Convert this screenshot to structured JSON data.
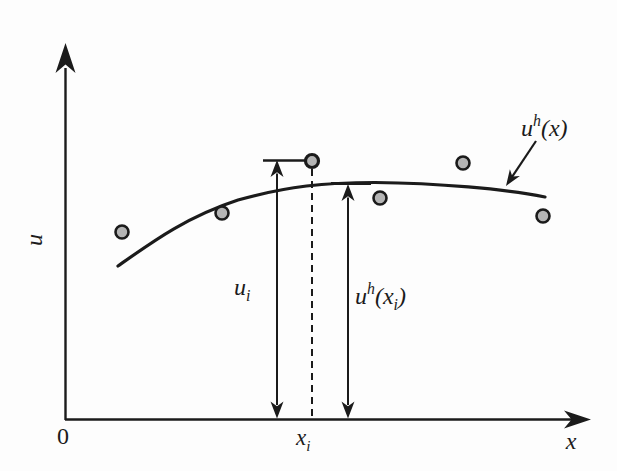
{
  "figure": {
    "background": "#fdfdfd",
    "ink": "#1b1b1b",
    "point_fill": "#b5b5b5",
    "axes": {
      "origin": [
        65,
        420
      ],
      "y_line_end": [
        65.5,
        68
      ],
      "y_tip": [
        65.5,
        43
      ],
      "y_head": {
        "len": 30,
        "halfw": 10
      },
      "x_line_end": [
        576,
        419.5
      ],
      "x_tip": [
        591,
        419.5
      ],
      "x_head": {
        "len": 27,
        "halfw": 9
      },
      "line_width": 2.4
    },
    "curve": {
      "path": "M 118 266 C 152 242 186 217 238 200 C 288 186 325 182.5 375 182.5 C 437 183 505 189 545 197",
      "width": 3.2
    },
    "points": [
      [
        122,
        232
      ],
      [
        222,
        213
      ],
      [
        380,
        198
      ],
      [
        463,
        163
      ],
      [
        543,
        216
      ]
    ],
    "special_point": [
      312,
      161
    ],
    "point_radius": 6.5,
    "ring_width": 2.6,
    "dashed_line": {
      "x": 312,
      "y1": 169,
      "y2": 419,
      "dash": "7 5",
      "width": 2
    },
    "measure_arrows": [
      {
        "name": "ui-measure-arrow",
        "x": 277,
        "top": 160,
        "bottom": 418.5,
        "cap": {
          "x1": 263,
          "x2": 305,
          "y": 160.5,
          "width": 2.5
        }
      },
      {
        "name": "uh-xi-measure-arrow",
        "x": 348,
        "top": 184,
        "bottom": 418.5,
        "cap": {
          "x1": 331,
          "x2": 371,
          "y": 183.5,
          "width": 3
        }
      }
    ],
    "measure_head": {
      "len": 17,
      "halfw": 6.5,
      "line_width": 2
    },
    "pointer_arrow": {
      "from": [
        536,
        141
      ],
      "tip": [
        506,
        186
      ],
      "len": 16,
      "halfw": 6,
      "width": 2.2
    },
    "labels": [
      {
        "name": "origin-label",
        "x": 63,
        "y": 444,
        "size": 24,
        "italic": false,
        "anchor": "middle",
        "parts": [
          {
            "t": "0"
          }
        ]
      },
      {
        "name": "y-axis-label",
        "x": 42,
        "y": 240,
        "size": 24,
        "italic": true,
        "anchor": "middle",
        "rotate": -90,
        "parts": [
          {
            "t": "u"
          }
        ]
      },
      {
        "name": "x-axis-label",
        "x": 571,
        "y": 449,
        "size": 24,
        "italic": true,
        "anchor": "middle",
        "parts": [
          {
            "t": "x"
          }
        ]
      },
      {
        "name": "xi-tick-label",
        "x": 296,
        "y": 445,
        "size": 23,
        "italic": true,
        "anchor": "start",
        "parts": [
          {
            "t": "x"
          },
          {
            "t": "i",
            "shift": "sub"
          }
        ]
      },
      {
        "name": "ui-label",
        "x": 234,
        "y": 295,
        "size": 24,
        "italic": true,
        "anchor": "start",
        "parts": [
          {
            "t": "u"
          },
          {
            "t": "i",
            "shift": "sub"
          }
        ]
      },
      {
        "name": "uh-xi-label",
        "x": 355,
        "y": 304,
        "size": 24,
        "italic": true,
        "anchor": "start",
        "parts": [
          {
            "t": "u"
          },
          {
            "t": "h",
            "shift": "sup"
          },
          {
            "t": "(x"
          },
          {
            "t": "i",
            "shift": "sub"
          },
          {
            "t": ")"
          }
        ]
      },
      {
        "name": "uh-x-label",
        "x": 521,
        "y": 136,
        "size": 24,
        "italic": true,
        "anchor": "start",
        "parts": [
          {
            "t": "u"
          },
          {
            "t": "h",
            "shift": "sup"
          },
          {
            "t": "(x)"
          }
        ]
      }
    ]
  },
  "chart_data": {
    "type": "scatter",
    "title": "",
    "xlabel": "x",
    "ylabel": "u",
    "axis_numeric_labels": false,
    "origin_label": "0",
    "x_ticks": [
      {
        "label": "x_i",
        "x_rel": 0.47
      }
    ],
    "series": [
      {
        "name": "data points",
        "type": "scatter",
        "points_rel": [
          [
            0.11,
            0.5
          ],
          [
            0.3,
            0.55
          ],
          [
            0.47,
            0.69
          ],
          [
            0.6,
            0.59
          ],
          [
            0.76,
            0.68
          ],
          [
            0.91,
            0.54
          ]
        ]
      },
      {
        "name": "u^h(x)",
        "type": "line",
        "points_rel": [
          [
            0.1,
            0.41
          ],
          [
            0.3,
            0.57
          ],
          [
            0.47,
            0.63
          ],
          [
            0.56,
            0.63
          ],
          [
            0.76,
            0.62
          ],
          [
            0.91,
            0.59
          ]
        ]
      }
    ],
    "highlighted_point": {
      "label_x": "x_i",
      "label_value": "u_i",
      "x_rel": 0.47,
      "u_i_rel": 0.69,
      "uh_xi_rel": 0.63
    },
    "annotations": [
      "u^h(x)",
      "u_i",
      "u^h(x_i)",
      "x_i"
    ],
    "legend": "none",
    "grid": false,
    "axis_range_note": "axes unlabeled (qualitative sketch)"
  }
}
